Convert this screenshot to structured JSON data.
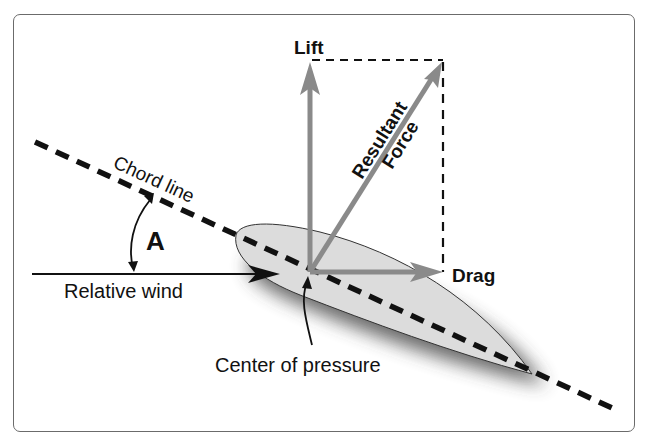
{
  "diagram": {
    "labels": {
      "lift": "Lift",
      "drag": "Drag",
      "resultant_line1": "Resultant",
      "resultant_line2": "Force",
      "chord_line": "Chord line",
      "angle": "A",
      "relative_wind": "Relative wind",
      "center_of_pressure": "Center of pressure"
    },
    "colors": {
      "force_arrow": "#8a8a8a",
      "airfoil_fill": "#dcdcdc",
      "line": "#111111",
      "frame": "#6b6b6b"
    }
  }
}
